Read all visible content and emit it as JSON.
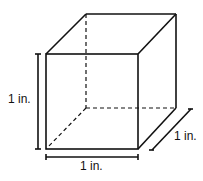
{
  "diagram": {
    "type": "cube",
    "labels": {
      "height": "1 in.",
      "width": "1 in.",
      "depth": "1 in."
    },
    "colors": {
      "line": "#111111",
      "background": "#ffffff"
    }
  }
}
